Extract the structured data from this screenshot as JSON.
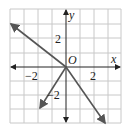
{
  "diagram": {
    "type": "coordinate-graph",
    "axes": {
      "x_label": "x",
      "y_label": "y",
      "origin_label": "O"
    },
    "tick_labels": {
      "x_neg": "−2",
      "x_pos": "2",
      "y_pos": "2",
      "y_neg": "−2"
    },
    "grid": {
      "x_range": [
        -4,
        4
      ],
      "y_range": [
        -4,
        4
      ],
      "step": 1
    },
    "lines": [
      {
        "name": "line-decreasing",
        "from": [
          -4,
          3.1
        ],
        "to": [
          3.1,
          -4
        ],
        "arrows": "both"
      },
      {
        "name": "ray-steep",
        "from": [
          0,
          0
        ],
        "to": [
          -2,
          -3
        ],
        "arrows": "end"
      }
    ],
    "colors": {
      "grid": "#c8c8c8",
      "axes": "#222222",
      "lines": "#555555"
    }
  }
}
